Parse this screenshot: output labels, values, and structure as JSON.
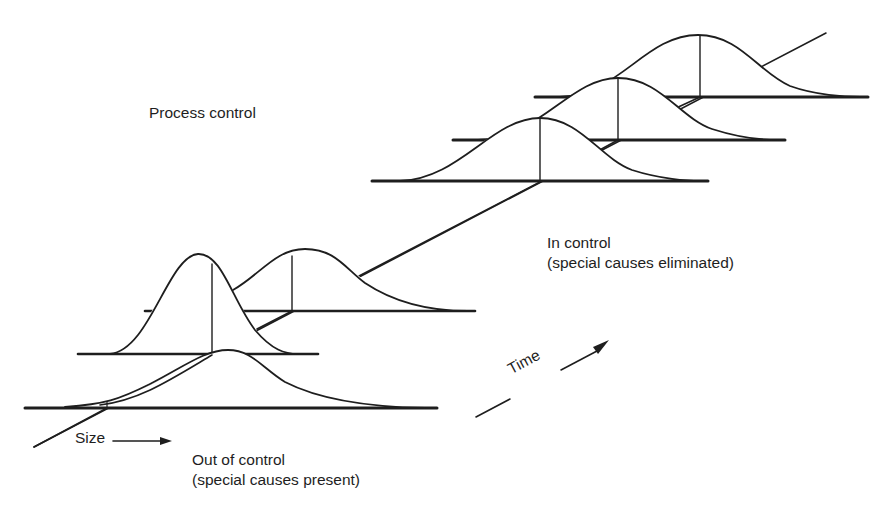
{
  "title": "Process control",
  "axes": {
    "size_label": "Size",
    "time_label": "Time"
  },
  "states": {
    "in_control": {
      "label": "In control",
      "sublabel": "(special causes eliminated)"
    },
    "out_of_control": {
      "label": "Out of control",
      "sublabel": "(special causes present)"
    }
  },
  "colors": {
    "ink": "#1e1e1e",
    "background": "#ffffff"
  },
  "distributions": [
    {
      "id": "out-1",
      "state": "out_of_control",
      "shape": "wide, right-skewed",
      "order": 1
    },
    {
      "id": "out-2",
      "state": "out_of_control",
      "shape": "tall, narrow",
      "order": 2
    },
    {
      "id": "out-3",
      "state": "out_of_control",
      "shape": "medium, right-skewed",
      "order": 3
    },
    {
      "id": "in-1",
      "state": "in_control",
      "shape": "normal",
      "order": 4
    },
    {
      "id": "in-2",
      "state": "in_control",
      "shape": "normal",
      "order": 5
    },
    {
      "id": "in-3",
      "state": "in_control",
      "shape": "normal",
      "order": 6
    }
  ]
}
